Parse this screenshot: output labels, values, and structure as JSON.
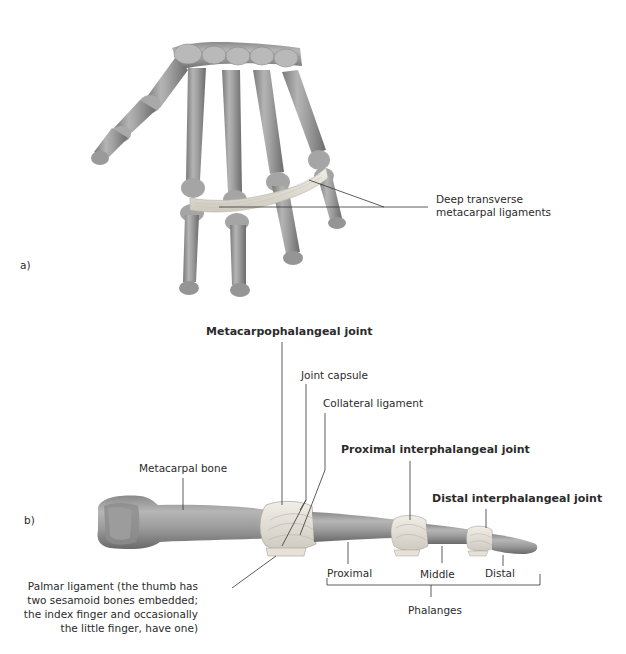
{
  "figure": {
    "panel_a": {
      "letter": "a)",
      "labels": {
        "deep_transverse": [
          "Deep transverse",
          "metacarpal ligaments"
        ]
      }
    },
    "panel_b": {
      "letter": "b)",
      "labels": {
        "mcp_joint": "Metacarpophalangeal joint",
        "joint_capsule": "Joint capsule",
        "collateral_ligament": "Collateral ligament",
        "pip_joint": "Proximal interphalangeal joint",
        "dip_joint": "Distal interphalangeal joint",
        "metacarpal_bone": "Metacarpal bone",
        "palmar_ligament": [
          "Palmar ligament (the thumb has",
          "two sesamoid bones embedded;",
          "the index finger and occasionally",
          "the little finger, have one)"
        ],
        "proximal": "Proximal",
        "middle": "Middle",
        "distal": "Distal",
        "phalanges": "Phalanges"
      }
    },
    "colors": {
      "bone_light": "#c9c9c9",
      "bone_mid": "#9a9a9a",
      "bone_dark": "#6e6e6e",
      "ligament": "#e8e4dc",
      "leader_line": "#333333",
      "text": "#2b2b2b"
    }
  }
}
